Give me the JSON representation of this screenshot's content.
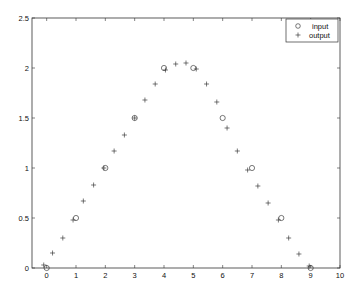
{
  "chart_data": {
    "type": "scatter",
    "title": "",
    "xlabel": "",
    "ylabel": "",
    "xlim": [
      -0.5,
      10
    ],
    "ylim": [
      0,
      2.5
    ],
    "grid": false,
    "legend_position": "top-right",
    "x_ticks": [
      "0",
      "1",
      "2",
      "3",
      "4",
      "5",
      "6",
      "7",
      "8",
      "9",
      "10"
    ],
    "y_ticks": [
      "0",
      "0.5",
      "1",
      "1.5",
      "2",
      "2.5"
    ],
    "series": [
      {
        "name": "input",
        "marker": "circle",
        "x": [
          0,
          1,
          2,
          3,
          4,
          5,
          6,
          7,
          8,
          9
        ],
        "y": [
          0,
          0.5,
          1,
          1.5,
          2,
          2,
          1.5,
          1,
          0.5,
          0
        ]
      },
      {
        "name": "output",
        "marker": "plus",
        "x": [
          -0.1,
          0.2,
          0.55,
          0.9,
          1.25,
          1.6,
          1.95,
          2.3,
          2.65,
          3.0,
          3.35,
          3.7,
          4.05,
          4.4,
          4.75,
          5.1,
          5.45,
          5.8,
          6.15,
          6.5,
          6.85,
          7.2,
          7.55,
          7.9,
          8.25,
          8.6,
          8.95
        ],
        "y": [
          0.03,
          0.15,
          0.3,
          0.48,
          0.67,
          0.83,
          1.0,
          1.17,
          1.33,
          1.5,
          1.68,
          1.84,
          1.98,
          2.04,
          2.05,
          1.99,
          1.84,
          1.66,
          1.4,
          1.17,
          0.98,
          0.82,
          0.65,
          0.48,
          0.3,
          0.14,
          0.02
        ]
      }
    ]
  },
  "legend": {
    "items": [
      {
        "label": "input",
        "symbol": "o"
      },
      {
        "label": "output",
        "symbol": "+"
      }
    ]
  }
}
